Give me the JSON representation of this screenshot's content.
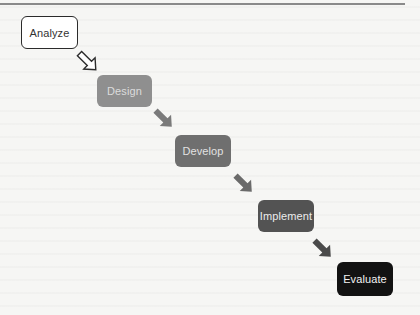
{
  "diagram": {
    "type": "staircase-process-flow",
    "steps": [
      {
        "label": "Analyze",
        "fill": "#ffffff",
        "text_color": "#333333",
        "border": "#2b2b2b"
      },
      {
        "label": "Design",
        "fill": "#8f8f8f",
        "text_color": "#dcdcdc"
      },
      {
        "label": "Develop",
        "fill": "#6f6f6f",
        "text_color": "#e2e2e2"
      },
      {
        "label": "Implement",
        "fill": "#535353",
        "text_color": "#ececec"
      },
      {
        "label": "Evaluate",
        "fill": "#121212",
        "text_color": "#f2f2f2"
      }
    ],
    "arrows": [
      {
        "from": "Analyze",
        "to": "Design",
        "style": "hollow",
        "icon": "arrow-down-right-outline"
      },
      {
        "from": "Design",
        "to": "Develop",
        "style": "filled",
        "color": "#7a7a7a",
        "icon": "arrow-down-right"
      },
      {
        "from": "Develop",
        "to": "Implement",
        "style": "filled",
        "color": "#6a6a6a",
        "icon": "arrow-down-right"
      },
      {
        "from": "Implement",
        "to": "Evaluate",
        "style": "filled",
        "color": "#4a4a4a",
        "icon": "arrow-down-right"
      }
    ]
  }
}
